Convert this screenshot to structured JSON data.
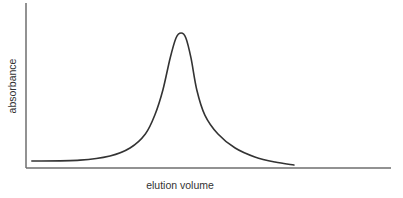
{
  "chart_data": {
    "type": "line",
    "title": "",
    "xlabel": "elution volume",
    "ylabel": "absorbance",
    "xlim": [
      0,
      1
    ],
    "ylim": [
      0,
      1
    ],
    "grid": false,
    "legend": "none",
    "x_ticks": [],
    "y_ticks": [],
    "series": [
      {
        "name": "elution peak",
        "color": "#333333",
        "x": [
          0.016,
          0.148,
          0.23,
          0.285,
          0.327,
          0.353,
          0.375,
          0.395,
          0.411,
          0.425,
          0.438,
          0.452,
          0.468,
          0.49,
          0.526,
          0.573,
          0.627,
          0.682,
          0.734
        ],
        "y": [
          0.042,
          0.048,
          0.073,
          0.121,
          0.206,
          0.321,
          0.473,
          0.667,
          0.788,
          0.818,
          0.788,
          0.667,
          0.473,
          0.321,
          0.206,
          0.121,
          0.067,
          0.036,
          0.018
        ]
      }
    ]
  }
}
